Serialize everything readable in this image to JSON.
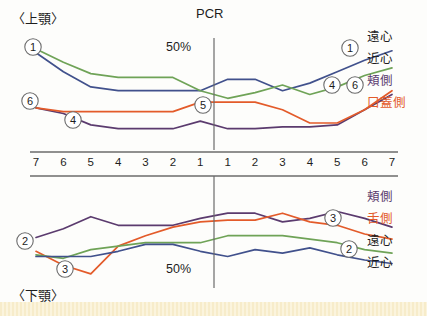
{
  "figure": {
    "upper_jaw_label": "〈上顎〉",
    "lower_jaw_label": "〈下顎〉",
    "pcr_label": "PCR",
    "upper_pct_label": "50%",
    "lower_pct_label": "50%"
  },
  "tooth_numbers": {
    "left": [
      "7",
      "6",
      "5",
      "4",
      "3",
      "2",
      "1"
    ],
    "right": [
      "1",
      "2",
      "3",
      "4",
      "5",
      "6",
      "7"
    ]
  },
  "upper_legend": [
    {
      "label": "遠心",
      "color": "#41518c"
    },
    {
      "label": "近心",
      "color": "#6fa357"
    },
    {
      "label": "頬側",
      "color": "#5b3b6e"
    },
    {
      "label": "口蓋側",
      "color": "#e35b2a"
    }
  ],
  "lower_legend": [
    {
      "label": "頬側",
      "color": "#5b3b6e"
    },
    {
      "label": "舌側",
      "color": "#e35b2a"
    },
    {
      "label": "遠心",
      "color": "#41518c"
    },
    {
      "label": "近心",
      "color": "#6fa357"
    }
  ],
  "markers": {
    "upper": [
      {
        "text": "1",
        "x": 33,
        "y": 47
      },
      {
        "text": "6",
        "x": 30,
        "y": 101
      },
      {
        "text": "4",
        "x": 73,
        "y": 120
      },
      {
        "text": "5",
        "x": 203,
        "y": 105
      },
      {
        "text": "1",
        "x": 350,
        "y": 48
      },
      {
        "text": "4",
        "x": 332,
        "y": 85
      },
      {
        "text": "6",
        "x": 355,
        "y": 85
      }
    ],
    "lower": [
      {
        "text": "2",
        "x": 25,
        "y": 241
      },
      {
        "text": "3",
        "x": 65,
        "y": 269
      },
      {
        "text": "3",
        "x": 333,
        "y": 218
      },
      {
        "text": "2",
        "x": 349,
        "y": 249
      }
    ]
  },
  "chart_data": {
    "type": "line",
    "title": "PCR",
    "subtitle": "Plaque Control Record by tooth position",
    "xlabel": "",
    "ylabel": "PCR",
    "grid": false,
    "legend_position": "right",
    "ylim": [
      0,
      100
    ],
    "x": [
      "R7",
      "R6",
      "R5",
      "R4",
      "R3",
      "R2",
      "R1",
      "L1",
      "L2",
      "L3",
      "L4",
      "L5",
      "L6",
      "L7"
    ],
    "panels": [
      {
        "name": "upper",
        "label": "〈上顎〉",
        "reference_line_label": "50%",
        "series": [
          {
            "name": "遠心",
            "color": "#41518c",
            "values": [
              62,
              52,
              44,
              42,
              42,
              42,
              42,
              48,
              48,
              42,
              46,
              52,
              58,
              63
            ]
          },
          {
            "name": "近心",
            "color": "#6fa357",
            "values": [
              64,
              57,
              51,
              49,
              49,
              49,
              42,
              38,
              41,
              45,
              40,
              44,
              50,
              54
            ]
          },
          {
            "name": "頬側",
            "color": "#5b3b6e",
            "values": [
              33,
              30,
              24,
              22,
              22,
              22,
              26,
              22,
              22,
              23,
              23,
              24,
              32,
              40
            ]
          },
          {
            "name": "口蓋側",
            "color": "#e35b2a",
            "values": [
              33,
              31,
              31,
              31,
              31,
              31,
              36,
              36,
              36,
              32,
              25,
              25,
              32,
              42
            ]
          }
        ]
      },
      {
        "name": "lower",
        "label": "〈下顎〉",
        "reference_line_label": "50%",
        "series": [
          {
            "name": "頬側",
            "color": "#5b3b6e",
            "values": [
              43,
              48,
              55,
              50,
              50,
              50,
              54,
              57,
              57,
              52,
              54,
              58,
              54,
              49
            ]
          },
          {
            "name": "舌側",
            "color": "#e35b2a",
            "values": [
              35,
              27,
              22,
              38,
              44,
              49,
              52,
              53,
              53,
              57,
              52,
              50,
              45,
              42
            ]
          },
          {
            "name": "近心",
            "color": "#6fa357",
            "values": [
              33,
              31,
              36,
              38,
              40,
              40,
              40,
              44,
              44,
              44,
              42,
              40,
              36,
              34
            ]
          },
          {
            "name": "遠心",
            "color": "#41518c",
            "values": [
              32,
              32,
              32,
              35,
              39,
              39,
              35,
              32,
              36,
              34,
              37,
              33,
              30,
              28
            ]
          }
        ]
      }
    ]
  }
}
